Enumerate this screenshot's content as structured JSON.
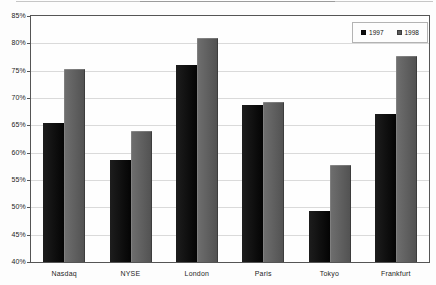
{
  "chart_data": {
    "type": "bar",
    "title": "",
    "xlabel": "",
    "ylabel": "",
    "categories": [
      "Nasdaq",
      "NYSE",
      "London",
      "Paris",
      "Tokyo",
      "Frankfurt"
    ],
    "series": [
      {
        "name": "1997",
        "color": "#0d0d0d",
        "values": [
          65.4,
          58.6,
          76.0,
          68.8,
          49.4,
          67.1
        ]
      },
      {
        "name": "1998",
        "color": "#5b5b5b",
        "values": [
          75.4,
          64.0,
          81.0,
          69.2,
          57.7,
          77.7
        ]
      }
    ],
    "ylim": [
      40,
      85
    ],
    "ytick_step": 5,
    "ytick_labels": [
      "85%",
      "80%",
      "75%",
      "70%",
      "65%",
      "60%",
      "55%",
      "50%",
      "45%",
      "40%"
    ],
    "grid": true,
    "legend_position": "top-right-inside"
  },
  "style": {
    "gridline_color": "#dadada",
    "plot_border_color": "#555555",
    "background": "#fdfdfd"
  }
}
